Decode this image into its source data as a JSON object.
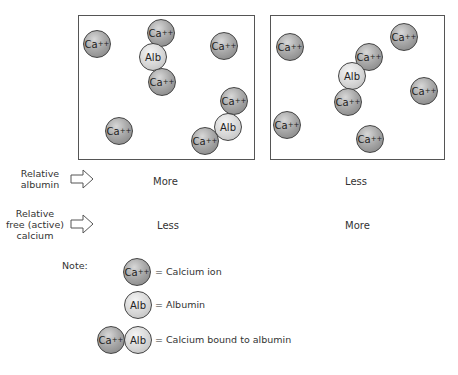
{
  "panels": [
    {
      "name": "more-albumin",
      "particles": [
        {
          "type": "ca",
          "label": "Ca",
          "charge": "++",
          "x": 97,
          "y": 44
        },
        {
          "type": "ca",
          "label": "Ca",
          "charge": "++",
          "x": 161,
          "y": 33
        },
        {
          "type": "alb",
          "label": "Alb",
          "x": 153,
          "y": 57
        },
        {
          "type": "ca",
          "label": "Ca",
          "charge": "++",
          "x": 162,
          "y": 82
        },
        {
          "type": "ca",
          "label": "Ca",
          "charge": "++",
          "x": 224,
          "y": 46
        },
        {
          "type": "ca",
          "label": "Ca",
          "charge": "++",
          "x": 234,
          "y": 101
        },
        {
          "type": "alb",
          "label": "Alb",
          "x": 228,
          "y": 127
        },
        {
          "type": "ca",
          "label": "Ca",
          "charge": "++",
          "x": 205,
          "y": 141
        },
        {
          "type": "ca",
          "label": "Ca",
          "charge": "++",
          "x": 119,
          "y": 131
        }
      ]
    },
    {
      "name": "less-albumin",
      "particles": [
        {
          "type": "ca",
          "label": "Ca",
          "charge": "++",
          "x": 290,
          "y": 47
        },
        {
          "type": "ca",
          "label": "Ca",
          "charge": "++",
          "x": 404,
          "y": 37
        },
        {
          "type": "ca",
          "label": "Ca",
          "charge": "++",
          "x": 369,
          "y": 57
        },
        {
          "type": "alb",
          "label": "Alb",
          "x": 352,
          "y": 76
        },
        {
          "type": "ca",
          "label": "Ca",
          "charge": "++",
          "x": 348,
          "y": 102
        },
        {
          "type": "ca",
          "label": "Ca",
          "charge": "++",
          "x": 424,
          "y": 91
        },
        {
          "type": "ca",
          "label": "Ca",
          "charge": "++",
          "x": 287,
          "y": 125
        },
        {
          "type": "ca",
          "label": "Ca",
          "charge": "++",
          "x": 370,
          "y": 139
        }
      ]
    }
  ],
  "rows": [
    {
      "label_lines": [
        "Relative",
        "albumin"
      ],
      "left": "More",
      "right": "Less"
    },
    {
      "label_lines": [
        "Relative",
        "free (active)",
        "calcium"
      ],
      "left": "Less",
      "right": "More"
    }
  ],
  "note": {
    "title": "Note:",
    "items": [
      {
        "symbol": "Ca++",
        "text": "= Calcium ion"
      },
      {
        "symbol": "Alb",
        "text": "= Albumin"
      },
      {
        "symbol": "Ca++ Alb",
        "text": "= Calcium bound to albumin"
      }
    ]
  },
  "symbols": {
    "ca": "Ca",
    "charge": "++",
    "alb": "Alb"
  }
}
